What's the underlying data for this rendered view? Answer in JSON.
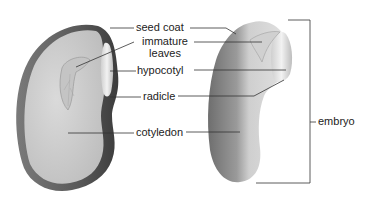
{
  "diagram": {
    "labels": {
      "seed_coat": "seed coat",
      "immature_leaves_line1": "immature",
      "immature_leaves_line2": "leaves",
      "hypocotyl": "hypocotyl",
      "radicle": "radicle",
      "cotyledon": "cotyledon",
      "embryo": "embryo"
    },
    "colors": {
      "background": "#ffffff",
      "seed_coat": "#5a5a5a",
      "cotyledon_fill": "#cfcfcf",
      "embryo_light": "#d9d9d9",
      "embryo_dark": "#8a8a8a",
      "leader_line": "#333333",
      "text": "#222222"
    }
  }
}
